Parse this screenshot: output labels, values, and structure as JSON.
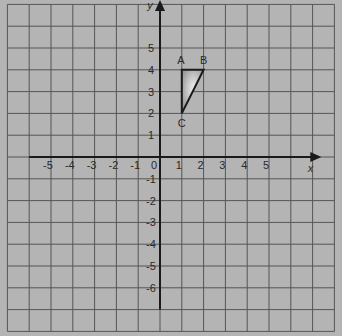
{
  "diagram": {
    "type": "coordinate-grid",
    "x_axis_label": "x",
    "y_axis_label": "y",
    "origin_label": "0",
    "x_range": [
      -7,
      8
    ],
    "y_range": [
      -8,
      7
    ],
    "x_tick_labels": [
      "-5",
      "-4",
      "-3",
      "-2",
      "-1",
      "1",
      "2",
      "3",
      "4",
      "5"
    ],
    "x_tick_values": [
      -5,
      -4,
      -3,
      -2,
      -1,
      1,
      2,
      3,
      4,
      5
    ],
    "y_tick_labels": [
      "5",
      "4",
      "3",
      "2",
      "1",
      "-1",
      "-2",
      "-3",
      "-4",
      "-5",
      "-6"
    ],
    "y_tick_values": [
      5,
      4,
      3,
      2,
      1,
      -1,
      -2,
      -3,
      -4,
      -5,
      -6
    ],
    "triangle": {
      "vertices": [
        {
          "label": "A",
          "x": 1,
          "y": 4
        },
        {
          "label": "B",
          "x": 2,
          "y": 4
        },
        {
          "label": "C",
          "x": 1,
          "y": 2
        }
      ]
    },
    "colors": {
      "background": "#b4b4b4",
      "grid": "#555555",
      "axis": "#1a1a1a",
      "text": "#2a2a2a",
      "triangle_fill_light": "#f2f2f2",
      "triangle_fill_dark": "#9a9a9a"
    }
  }
}
